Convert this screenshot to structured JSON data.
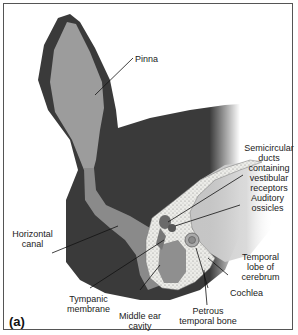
{
  "figure": {
    "panel_tag": "(a)",
    "colors": {
      "skin": "#3a3a3a",
      "canal": "#8e8e8e",
      "pinna_inner": "#9a9a9a",
      "bone": "#e4e4e0",
      "brain": "#c8c8c8",
      "background": "#ffffff"
    }
  },
  "labels": {
    "pinna": "Pinna",
    "semicircular": [
      "Semicircular",
      "ducts",
      "containing",
      "vestibular",
      "receptors"
    ],
    "ossicles": [
      "Auditory",
      "ossicles"
    ],
    "horizontal_canal": [
      "Horizontal",
      "canal"
    ],
    "temporal_lobe": [
      "Temporal",
      "lobe of",
      "cerebrum"
    ],
    "tympanic": [
      "Tympanic",
      "membrane"
    ],
    "cochlea": "Cochlea",
    "middle_ear": [
      "Middle ear",
      "cavity"
    ],
    "petrous": [
      "Petrous",
      "temporal bone"
    ]
  }
}
